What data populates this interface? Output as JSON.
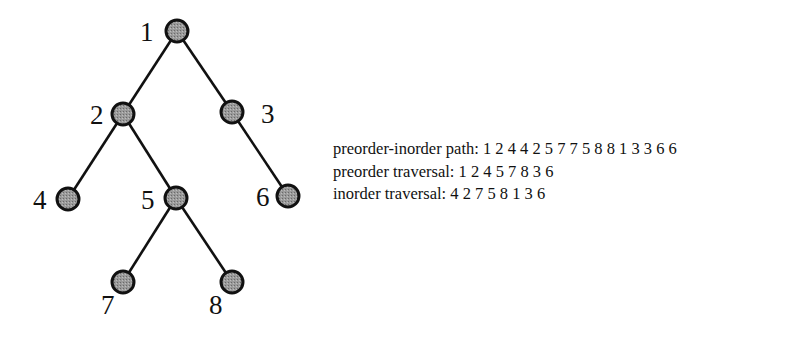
{
  "tree": {
    "node_fill": "#8a8a8a",
    "nodes": [
      {
        "id": "1",
        "label": "1",
        "cx": 177,
        "cy": 31,
        "lx": 140,
        "ly": 41
      },
      {
        "id": "2",
        "label": "2",
        "cx": 123,
        "cy": 114,
        "lx": 90,
        "ly": 124
      },
      {
        "id": "3",
        "label": "3",
        "cx": 232,
        "cy": 112,
        "lx": 261,
        "ly": 123
      },
      {
        "id": "4",
        "label": "4",
        "cx": 68,
        "cy": 199,
        "lx": 33,
        "ly": 209
      },
      {
        "id": "5",
        "label": "5",
        "cx": 176,
        "cy": 198,
        "lx": 141,
        "ly": 209
      },
      {
        "id": "6",
        "label": "6",
        "cx": 288,
        "cy": 196,
        "lx": 256,
        "ly": 206
      },
      {
        "id": "7",
        "label": "7",
        "cx": 123,
        "cy": 282,
        "lx": 101,
        "ly": 314
      },
      {
        "id": "8",
        "label": "8",
        "cx": 232,
        "cy": 282,
        "lx": 209,
        "ly": 314
      }
    ],
    "edges": [
      [
        "1",
        "2"
      ],
      [
        "1",
        "3"
      ],
      [
        "2",
        "4"
      ],
      [
        "2",
        "5"
      ],
      [
        "3",
        "6"
      ],
      [
        "5",
        "7"
      ],
      [
        "5",
        "8"
      ]
    ]
  },
  "traversals": {
    "path_label": "preorder-inorder path:",
    "path_values": "1 2 4 4 2 5 7 7 5 8 8 1 3 3 6 6",
    "preorder_label": "preorder traversal:",
    "preorder_values": "1 2 4 5 7 8 3 6",
    "inorder_label": "inorder traversal:",
    "inorder_values": "4 2 7 5 8 1 3 6"
  }
}
